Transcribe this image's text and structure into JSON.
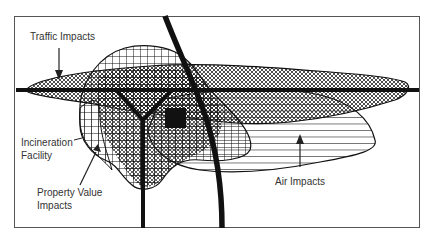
{
  "diagram": {
    "labels": {
      "traffic": "Traffic Impacts",
      "incineration_line1": "Incineration",
      "incineration_line2": "Facility",
      "property_line1": "Property Value",
      "property_line2": "Impacts",
      "air": "Air Impacts"
    },
    "colors": {
      "ink": "#111111",
      "frame": "#555555",
      "background": "#ffffff",
      "text": "#333333"
    },
    "zones": [
      {
        "name": "Traffic Impacts",
        "pattern": "crosshatch"
      },
      {
        "name": "Property Value Impacts",
        "pattern": "vertical-grid"
      },
      {
        "name": "Air Impacts",
        "pattern": "horizontal-lines"
      }
    ]
  }
}
